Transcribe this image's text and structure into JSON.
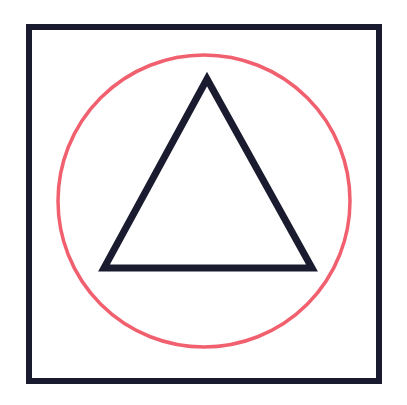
{
  "canvas": {
    "name": "geometric-figure",
    "width": 407,
    "height": 405,
    "background_color": "#ffffff",
    "description": "Line drawing: a dark square frame enclosing a coral circle, with a dark outlined triangle centered inside"
  },
  "palette": {
    "ink_dark": "#1b1b2f",
    "coral_red": "#f0606e",
    "paper_white": "#ffffff"
  },
  "shapes": [
    {
      "id": "square-frame",
      "type": "rectangle",
      "label": "Square",
      "stroke_color": "#1b1b2f",
      "stroke_width": 6,
      "fill": "none",
      "x": 29,
      "y": 27,
      "width": 350,
      "height": 354
    },
    {
      "id": "circle-outline",
      "type": "circle",
      "label": "Circle",
      "stroke_color": "#f0606e",
      "stroke_width": 3.5,
      "fill": "none",
      "cx": 204,
      "cy": 201,
      "r": 146
    },
    {
      "id": "triangle-outline",
      "type": "triangle",
      "label": "Triangle",
      "stroke_color": "#1b1b2f",
      "stroke_width": 7,
      "fill": "none",
      "points": "207,79 312,268 104,268",
      "vertices": [
        {
          "name": "apex",
          "x": 207,
          "y": 79
        },
        {
          "name": "bottom-right",
          "x": 312,
          "y": 268
        },
        {
          "name": "bottom-left",
          "x": 104,
          "y": 268
        }
      ]
    }
  ]
}
